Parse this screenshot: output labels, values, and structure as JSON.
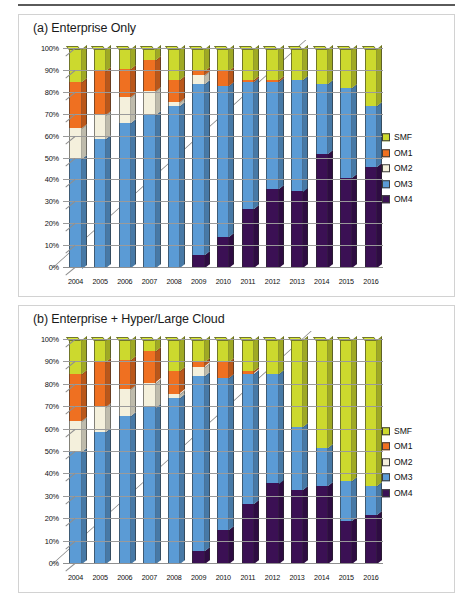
{
  "figure": {
    "panels": [
      {
        "id": "a",
        "title": "(a) Enterprise Only"
      },
      {
        "id": "b",
        "title": "(b) Enterprise + Hyper/Large Cloud"
      }
    ],
    "series_colors": {
      "SMF": "#ccd92e",
      "OM1": "#ef7021",
      "OM2": "#f4f0dc",
      "OM3": "#5b9bd5",
      "OM4": "#3b1054"
    },
    "legend_position": "right",
    "ytick_labels": [
      "0%",
      "10%",
      "20%",
      "30%",
      "40%",
      "50%",
      "60%",
      "70%",
      "80%",
      "90%",
      "100%"
    ],
    "legend_items": [
      "SMF",
      "OM1",
      "OM2",
      "OM3",
      "OM4"
    ]
  },
  "chart_data": [
    {
      "type": "bar",
      "stacked": true,
      "normalized": true,
      "title": "(a) Enterprise Only",
      "xlabel": "",
      "ylabel": "",
      "ylim": [
        0,
        100
      ],
      "grid": true,
      "legend": [
        "SMF",
        "OM1",
        "OM2",
        "OM3",
        "OM4"
      ],
      "categories": [
        "2004",
        "2005",
        "2006",
        "2007",
        "2008",
        "2009",
        "2010",
        "2011",
        "2012",
        "2013",
        "2014",
        "2015",
        "2016"
      ],
      "series": [
        {
          "name": "OM4",
          "values": [
            0,
            0,
            0,
            0,
            0,
            6,
            14,
            27,
            36,
            35,
            52,
            41,
            46
          ]
        },
        {
          "name": "OM3",
          "values": [
            50,
            59,
            66,
            70,
            74,
            78,
            69,
            58,
            49,
            51,
            32,
            41,
            28
          ]
        },
        {
          "name": "OM2",
          "values": [
            14,
            11,
            12,
            11,
            2,
            4,
            0,
            0,
            0,
            0,
            0,
            0,
            0
          ]
        },
        {
          "name": "OM1",
          "values": [
            21,
            20,
            13,
            14,
            10,
            2,
            7,
            1,
            1,
            0,
            0,
            0,
            0
          ]
        },
        {
          "name": "SMF",
          "values": [
            15,
            10,
            9,
            5,
            14,
            10,
            10,
            14,
            14,
            14,
            16,
            18,
            26
          ]
        }
      ]
    },
    {
      "type": "bar",
      "stacked": true,
      "normalized": true,
      "title": "(b) Enterprise + Hyper/Large Cloud",
      "xlabel": "",
      "ylabel": "",
      "ylim": [
        0,
        100
      ],
      "grid": true,
      "legend": [
        "SMF",
        "OM1",
        "OM2",
        "OM3",
        "OM4"
      ],
      "categories": [
        "2004",
        "2005",
        "2006",
        "2007",
        "2008",
        "2009",
        "2010",
        "2011",
        "2012",
        "2013",
        "2014",
        "2015",
        "2016"
      ],
      "series": [
        {
          "name": "OM4",
          "values": [
            0,
            0,
            0,
            0,
            0,
            6,
            15,
            27,
            36,
            33,
            35,
            19,
            22
          ]
        },
        {
          "name": "OM3",
          "values": [
            50,
            59,
            66,
            70,
            74,
            78,
            68,
            58,
            49,
            28,
            17,
            18,
            13
          ]
        },
        {
          "name": "OM2",
          "values": [
            14,
            11,
            12,
            11,
            2,
            4,
            0,
            0,
            0,
            0,
            0,
            0,
            0
          ]
        },
        {
          "name": "OM1",
          "values": [
            21,
            20,
            13,
            14,
            10,
            2,
            7,
            1,
            0,
            0,
            0,
            0,
            0
          ]
        },
        {
          "name": "SMF",
          "values": [
            15,
            10,
            9,
            5,
            14,
            10,
            10,
            14,
            15,
            39,
            48,
            63,
            65
          ]
        }
      ]
    }
  ]
}
